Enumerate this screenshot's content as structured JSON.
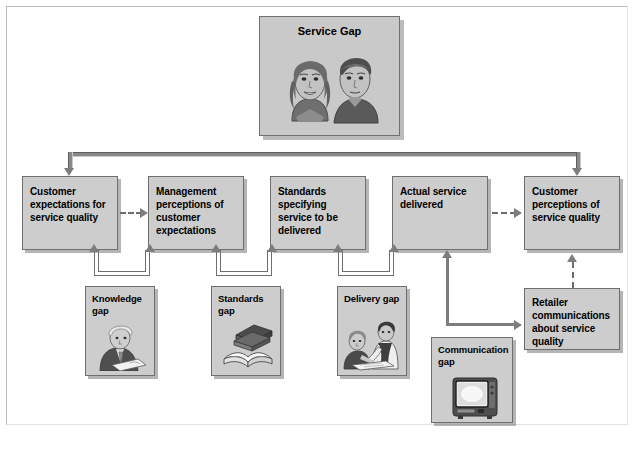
{
  "diagram": {
    "title_card": {
      "label": "Service Gap",
      "illustration": "two-faces-portrait"
    },
    "process_boxes": [
      {
        "id": "customer-expectations",
        "label": "Customer expectations for service quality"
      },
      {
        "id": "management-perceptions",
        "label": "Management perceptions of customer expectations"
      },
      {
        "id": "standards-specifying",
        "label": "Standards specifying service to be delivered"
      },
      {
        "id": "actual-service",
        "label": "Actual service delivered"
      },
      {
        "id": "customer-perceptions",
        "label": "Customer perceptions of service quality"
      }
    ],
    "retailer_box": {
      "id": "retailer-communications",
      "label": "Retailer communications about service quality"
    },
    "gap_boxes": [
      {
        "id": "knowledge-gap",
        "label": "Knowledge gap",
        "illustration": "seated-man-reading"
      },
      {
        "id": "standards-gap",
        "label": "Standards gap",
        "illustration": "stacked-open-books"
      },
      {
        "id": "delivery-gap",
        "label": "Delivery gap",
        "illustration": "two-people-at-desk"
      },
      {
        "id": "communication-gap",
        "label": "Communication gap",
        "illustration": "television-set"
      }
    ],
    "colors": {
      "box_fill": "#cdcdcd",
      "box_border": "#6e6e6e",
      "connector": "#7d7d7d",
      "page_background": "#ffffff",
      "text": "#000000"
    }
  }
}
